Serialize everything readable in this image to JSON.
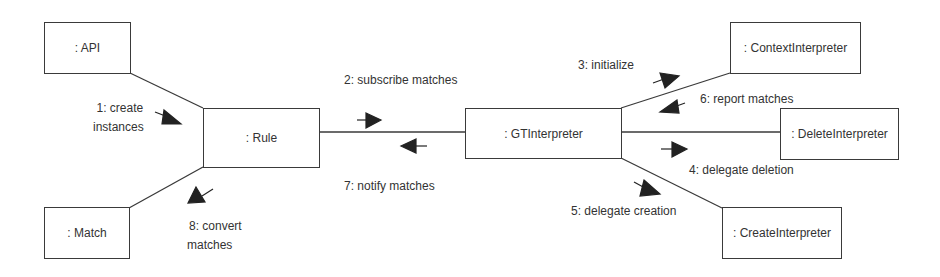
{
  "diagram": {
    "type": "UML communication diagram",
    "colors": {
      "line": "#3a3a3a",
      "text": "#333333",
      "background": "#ffffff"
    },
    "objects": {
      "api": ": API",
      "match": ": Match",
      "rule": ": Rule",
      "gt_interpreter": ": GTInterpreter",
      "context_interpreter": ": ContextInterpreter",
      "delete_interpreter": ": DeleteInterpreter",
      "create_interpreter": ": CreateInterpreter"
    },
    "messages": {
      "m1_line1": "1: create",
      "m1_line2": "instances",
      "m2": "2: subscribe matches",
      "m3": "3: initialize",
      "m4": "4: delegate deletion",
      "m5": "5: delegate creation",
      "m6": "6: report matches",
      "m7": "7: notify matches",
      "m8_line1": "8: convert",
      "m8_line2": "matches"
    }
  }
}
